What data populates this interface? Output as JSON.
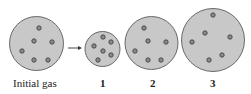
{
  "diagram": {
    "colors": {
      "fill": "#c8c8c8",
      "stroke": "#5a5a5a",
      "dot_fill": "#8a8a8a",
      "dot_stroke": "#3a3a3a"
    },
    "containers": [
      {
        "id": "initial",
        "label": "Initial gas",
        "cx": 36.5,
        "cy": 43.5,
        "r": 27,
        "dots": [
          [
            39,
            28
          ],
          [
            34,
            41
          ],
          [
            52,
            42
          ],
          [
            22,
            51
          ],
          [
            34,
            60
          ],
          [
            48,
            60
          ]
        ]
      },
      {
        "id": "1",
        "label": "1",
        "cx": 102.5,
        "cy": 49,
        "r": 17.5,
        "dots": [
          [
            103,
            37
          ],
          [
            111,
            42
          ],
          [
            94,
            46
          ],
          [
            103,
            51
          ],
          [
            111,
            55
          ],
          [
            98,
            60
          ]
        ]
      },
      {
        "id": "2",
        "label": "2",
        "cx": 151.5,
        "cy": 43,
        "r": 26.5,
        "dots": [
          [
            144,
            28
          ],
          [
            148,
            41
          ],
          [
            166,
            42
          ],
          [
            135,
            51
          ],
          [
            148,
            60
          ],
          [
            161,
            60
          ]
        ]
      },
      {
        "id": "3",
        "label": "3",
        "cx": 213,
        "cy": 40,
        "r": 31.5,
        "dots": [
          [
            213,
            15
          ],
          [
            205,
            33
          ],
          [
            230,
            37
          ],
          [
            192,
            42
          ],
          [
            222,
            55
          ],
          [
            209,
            60
          ]
        ]
      }
    ],
    "arrow": {
      "from": [
        68,
        48
      ],
      "to": [
        82,
        48
      ]
    },
    "labels": {
      "initial": "Initial gas",
      "c1": "1",
      "c2": "2",
      "c3": "3"
    }
  }
}
